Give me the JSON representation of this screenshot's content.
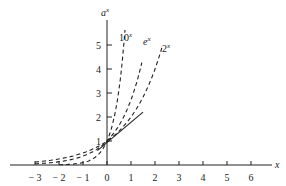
{
  "chart_data": {
    "type": "line",
    "title": "",
    "xlabel": "x",
    "ylabel": "a^x",
    "xlim": [
      -3.5,
      6.5
    ],
    "ylim": [
      0,
      5.5
    ],
    "x_ticks": [
      -3,
      -2,
      -1,
      0,
      1,
      2,
      3,
      4,
      5,
      6
    ],
    "x_tick_labels": [
      "− 3",
      "− 2",
      "− 1",
      "0",
      "1",
      "2",
      "3",
      "4",
      "5",
      "6"
    ],
    "y_ticks": [
      1,
      2,
      3,
      4,
      5
    ],
    "y_tick_labels": [
      "1",
      "2",
      "3",
      "4",
      "5"
    ],
    "grid": false,
    "series": [
      {
        "name": "10^x",
        "label_base": "10",
        "label_exp": "x",
        "style": "dashed",
        "x_range": [
          -2.0,
          0.75
        ]
      },
      {
        "name": "e^x",
        "label_base": "e",
        "label_exp": "x",
        "style": "dashed",
        "x_range": [
          -3.0,
          1.45
        ]
      },
      {
        "name": "2^x",
        "label_base": "2",
        "label_exp": "x",
        "style": "dashed",
        "x_range": [
          -3.0,
          2.3
        ]
      },
      {
        "name": "tangent",
        "style": "solid",
        "x": [
          -0.4,
          1.5
        ],
        "y": [
          0.6,
          2.2
        ]
      }
    ]
  },
  "axis": {
    "x_label": "x",
    "y_label_base": "a",
    "y_label_exp": "x"
  },
  "legend": [
    {
      "base": "10",
      "exp": "x"
    },
    {
      "base": "e",
      "exp": "x"
    },
    {
      "base": "2",
      "exp": "x"
    }
  ]
}
